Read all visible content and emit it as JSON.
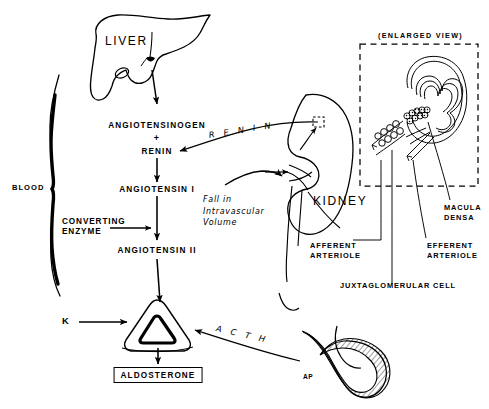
{
  "diagram": {
    "style": "hand-drawn medical line illustration, black ink on white",
    "colors": {
      "ink": "#000000",
      "paper": "#ffffff"
    }
  },
  "organs": {
    "liver": "LIVER",
    "kidney": "KIDNEY",
    "pituitary_label": "AP"
  },
  "enlarged_view": {
    "caption": "(ENLARGED VIEW)"
  },
  "cascade": {
    "angiotensinogen": "ANGIOTENSINOGEN",
    "plus": "+",
    "renin": "RENIN",
    "angiotensin_1": "ANGIOTENSIN I",
    "angiotensin_2": "ANGIOTENSIN II",
    "aldosterone": "ALDOSTERONE"
  },
  "modifiers": {
    "converting_enzyme": "CONVERTING\nENZYME",
    "potassium": "K",
    "blood": "BLOOD"
  },
  "flow_labels": {
    "renin_arrow": "R E N I N",
    "acth_arrow": "A C T H",
    "fall_volume": "Fall in\nIntravascular\nVolume"
  },
  "anatomy_labels": {
    "afferent_arteriole": "AFFERENT\nARTERIOLE",
    "efferent_arteriole": "EFFERENT\nARTERIOLE",
    "macula_densa": "MACULA\nDENSA",
    "juxtaglomerular_cell": "JUXTAGLOMERULAR CELL"
  }
}
